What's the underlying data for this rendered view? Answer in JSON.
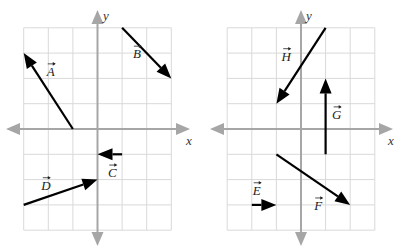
{
  "caption_fragment": "",
  "graphs": [
    {
      "id": "left",
      "x_axis_label": "x",
      "y_axis_label": "y",
      "grid": {
        "x_min": -3,
        "x_max": 3,
        "y_min": -4,
        "y_max": 4
      },
      "vectors": [
        {
          "name": "A",
          "label": "A",
          "tail": [
            -1,
            0
          ],
          "head": [
            -3,
            3
          ],
          "label_at": [
            -1.9,
            2.1
          ]
        },
        {
          "name": "B",
          "label": "B",
          "tail": [
            1,
            4
          ],
          "head": [
            3,
            2
          ],
          "label_at": [
            1.6,
            2.8
          ]
        },
        {
          "name": "C",
          "label": "C",
          "tail": [
            1,
            -1
          ],
          "head": [
            0,
            -1
          ],
          "label_at": [
            0.6,
            -1.9
          ]
        },
        {
          "name": "D",
          "label": "D",
          "tail": [
            -3,
            -3
          ],
          "head": [
            0,
            -2
          ],
          "label_at": [
            -2.1,
            -2.4
          ]
        }
      ]
    },
    {
      "id": "right",
      "x_axis_label": "x",
      "y_axis_label": "y",
      "grid": {
        "x_min": -3,
        "x_max": 3,
        "y_min": -4,
        "y_max": 4
      },
      "vectors": [
        {
          "name": "H",
          "label": "H",
          "tail": [
            1,
            4
          ],
          "head": [
            -1,
            1
          ],
          "label_at": [
            -0.6,
            2.7
          ]
        },
        {
          "name": "G",
          "label": "G",
          "tail": [
            1,
            -1
          ],
          "head": [
            1,
            2
          ],
          "label_at": [
            1.45,
            0.4
          ]
        },
        {
          "name": "F",
          "label": "F",
          "tail": [
            -1,
            -1
          ],
          "head": [
            2,
            -3
          ],
          "label_at": [
            0.7,
            -3.2
          ]
        },
        {
          "name": "E",
          "label": "E",
          "tail": [
            -2,
            -3
          ],
          "head": [
            -1,
            -3
          ],
          "label_at": [
            -1.8,
            -2.6
          ]
        }
      ]
    }
  ]
}
